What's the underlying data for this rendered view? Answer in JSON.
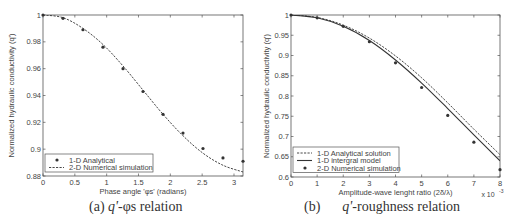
{
  "chart_data": [
    {
      "type": "line",
      "panel": "a",
      "title": "",
      "caption": "(a) q'-φs relation",
      "xlabel": "Phase angle 'φs' (radians)",
      "ylabel": "Normalized hydraulic conductivity (q')",
      "xlim": [
        0,
        3.1416
      ],
      "ylim": [
        0.88,
        1.0
      ],
      "xticks": [
        0,
        0.5,
        1,
        1.5,
        2,
        2.5,
        3
      ],
      "yticks": [
        0.88,
        0.9,
        0.92,
        0.94,
        0.96,
        0.98,
        1
      ],
      "grid": false,
      "legend_position": "lower left",
      "series": [
        {
          "name": "1-D Analytical",
          "style": "markers",
          "x": [
            0,
            0.314,
            0.628,
            0.942,
            1.257,
            1.571,
            1.885,
            2.199,
            2.513,
            2.827,
            3.142
          ],
          "y": [
            1.0,
            0.9975,
            0.989,
            0.976,
            0.96,
            0.943,
            0.926,
            0.912,
            0.9005,
            0.8935,
            0.891
          ]
        },
        {
          "name": "2-D Numerical simulation",
          "style": "dashed",
          "x": [
            0,
            0.314,
            0.628,
            0.942,
            1.257,
            1.571,
            1.885,
            2.199,
            2.513,
            2.827,
            3.142
          ],
          "y": [
            1.0,
            0.998,
            0.99,
            0.978,
            0.962,
            0.944,
            0.926,
            0.91,
            0.897,
            0.888,
            0.883
          ]
        }
      ]
    },
    {
      "type": "line",
      "panel": "b",
      "title": "",
      "caption": "(b) q'-roughness relation",
      "xlabel": "Amplitude-wave lenght ratio (2δ/λ)",
      "ylabel": "Normalized hydraulic conductivity (q')",
      "x_multiplier": "x 10^-3",
      "xlim": [
        0,
        8
      ],
      "ylim": [
        0.6,
        1.0
      ],
      "xticks": [
        0,
        1,
        2,
        3,
        4,
        5,
        6,
        7,
        8
      ],
      "yticks": [
        0.6,
        0.65,
        0.7,
        0.75,
        0.8,
        0.85,
        0.9,
        0.95,
        1
      ],
      "grid": false,
      "legend_position": "lower left",
      "series": [
        {
          "name": "1-D Analytical solution",
          "style": "dashed",
          "x": [
            0,
            1,
            2,
            3,
            4,
            5,
            6,
            7,
            8
          ],
          "y": [
            1.0,
            0.994,
            0.975,
            0.943,
            0.899,
            0.845,
            0.783,
            0.718,
            0.655
          ]
        },
        {
          "name": "1-D intergral model",
          "style": "solid",
          "x": [
            0,
            1,
            2,
            3,
            4,
            5,
            6,
            7,
            8
          ],
          "y": [
            1.0,
            0.993,
            0.972,
            0.937,
            0.889,
            0.832,
            0.769,
            0.704,
            0.64
          ]
        },
        {
          "name": "2-D Numerical simulation",
          "style": "markers",
          "x": [
            0,
            1,
            2,
            3,
            4,
            5,
            6,
            7,
            8
          ],
          "y": [
            1.0,
            0.993,
            0.972,
            0.934,
            0.882,
            0.821,
            0.752,
            0.686,
            0.618
          ]
        }
      ]
    }
  ],
  "panels": {
    "a": {
      "xlabel": "Phase angle 'φs' (radians)",
      "ylabel": "Normalized hydraulic conductivity (q')",
      "xticks": [
        "0",
        "0.5",
        "1",
        "1.5",
        "2",
        "2.5",
        "3"
      ],
      "yticks": [
        "0.88",
        "0.9",
        "0.92",
        "0.94",
        "0.96",
        "0.98",
        "1"
      ],
      "legend": [
        "1-D Analytical",
        "2-D Numerical simulation"
      ],
      "caption_prefix": "(a) ",
      "caption_var": "q'",
      "caption_rest": "-φs relation"
    },
    "b": {
      "xlabel": "Amplitude-wave lenght ratio (2δ/λ)",
      "ylabel": "Normalized hydraulic conductivity (q')",
      "xticks": [
        "0",
        "1",
        "2",
        "3",
        "4",
        "5",
        "6",
        "7",
        "8"
      ],
      "yticks": [
        "0.6",
        "0.65",
        "0.7",
        "0.75",
        "0.8",
        "0.85",
        "0.9",
        "0.95",
        "1"
      ],
      "multiplier": "x 10",
      "multiplier_exp": "-3",
      "legend": [
        "1-D Analytical solution",
        "1-D intergral model",
        "2-D Numerical simulation"
      ],
      "caption_prefix": "(b)",
      "caption_var": "q'",
      "caption_rest": "-roughness relation"
    }
  }
}
